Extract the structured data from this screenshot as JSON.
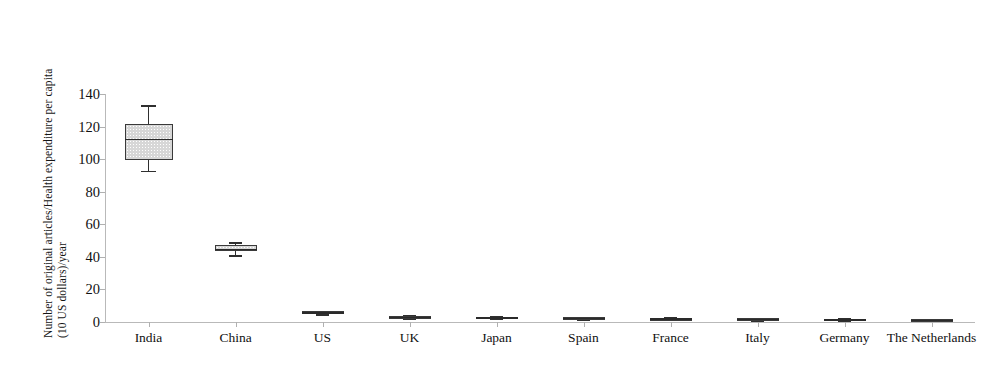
{
  "chart_data": {
    "type": "box",
    "title": "",
    "xlabel": "",
    "ylabel": "Number of original articles/Health expenditure per capita (10 US dollars)/year",
    "ylabel_lines": [
      "Number of original articles/Health expenditure per capita",
      "(10 US dollars)/year"
    ],
    "ylim": [
      0,
      140
    ],
    "ytick_values": [
      0,
      20,
      40,
      60,
      80,
      100,
      120,
      140
    ],
    "ytick_labels": [
      "0",
      "20",
      "40",
      "60",
      "80",
      "100",
      "120",
      "140"
    ],
    "grid": false,
    "legend": "none",
    "categories": [
      "India",
      "China",
      "US",
      "UK",
      "Japan",
      "Spain",
      "France",
      "Italy",
      "Germany",
      "The Netherlands"
    ],
    "boxes": [
      {
        "category": "India",
        "min": 93.0,
        "q1": 99.5,
        "median": 112.5,
        "q3": 121.5,
        "max": 133.0
      },
      {
        "category": "China",
        "min": 41.0,
        "q1": 43.5,
        "median": 45.0,
        "q3": 47.0,
        "max": 49.0
      },
      {
        "category": "US",
        "min": 5.0,
        "q1": 5.5,
        "median": 6.0,
        "q3": 6.5,
        "max": 7.0
      },
      {
        "category": "UK",
        "min": 2.5,
        "q1": 3.0,
        "median": 3.3,
        "q3": 3.6,
        "max": 4.2
      },
      {
        "category": "Japan",
        "min": 2.2,
        "q1": 2.6,
        "median": 2.9,
        "q3": 3.2,
        "max": 3.7
      },
      {
        "category": "Spain",
        "min": 1.9,
        "q1": 2.3,
        "median": 2.6,
        "q3": 2.9,
        "max": 3.3
      },
      {
        "category": "France",
        "min": 1.6,
        "q1": 1.9,
        "median": 2.2,
        "q3": 2.5,
        "max": 2.9
      },
      {
        "category": "Italy",
        "min": 1.3,
        "q1": 1.6,
        "median": 1.9,
        "q3": 2.2,
        "max": 2.6
      },
      {
        "category": "Germany",
        "min": 1.2,
        "q1": 1.5,
        "median": 1.8,
        "q3": 2.1,
        "max": 2.5
      },
      {
        "category": "The Netherlands",
        "min": 0.9,
        "q1": 1.2,
        "median": 1.4,
        "q3": 1.7,
        "max": 2.1
      }
    ],
    "colors": {
      "box_fill": "#d7d7d7",
      "box_edge": "#3a3a3a",
      "median": "#2a2a2a",
      "whisker": "#2f2f2f",
      "axis": "#b9b9b9",
      "background": "#ffffff",
      "text": "#111111"
    }
  }
}
